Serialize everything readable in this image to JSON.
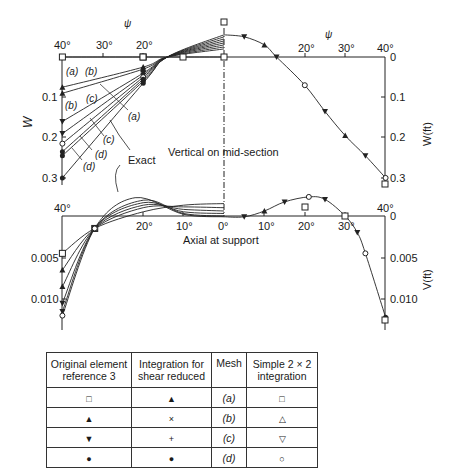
{
  "chart_data": [
    {
      "type": "line",
      "title": "Vertical on mid-section",
      "xlabel": "ψ",
      "ylabel_left": "W",
      "ylabel_right": "W(ft)",
      "x_ticks_left": [
        "40°",
        "30°",
        "20°"
      ],
      "x_ticks_right": [
        "20°",
        "30°",
        "40°"
      ],
      "y_ticks": [
        "0",
        "0.1",
        "0.2",
        "0.3"
      ],
      "ylim": [
        -0.06,
        0.32
      ],
      "y_inverted": true,
      "grid": false,
      "left_half_curves": [
        {
          "name": "(a) original/simple",
          "points": [
            [
              40,
              0.0
            ],
            [
              20,
              0.0
            ],
            [
              0,
              0.0
            ]
          ]
        },
        {
          "name": "(b)",
          "points": [
            [
              40,
              0.075
            ],
            [
              20,
              0.025
            ],
            [
              14,
              0.0
            ],
            [
              0,
              -0.02
            ]
          ]
        },
        {
          "name": "(b')",
          "points": [
            [
              40,
              0.09
            ],
            [
              20,
              0.03
            ],
            [
              14,
              0.0
            ],
            [
              0,
              -0.025
            ]
          ]
        },
        {
          "name": "(c)",
          "points": [
            [
              40,
              0.16
            ],
            [
              20,
              0.04
            ],
            [
              14,
              0.0
            ],
            [
              0,
              -0.03
            ]
          ]
        },
        {
          "name": "(c')",
          "points": [
            [
              40,
              0.19
            ],
            [
              20,
              0.045
            ],
            [
              14,
              0.0
            ],
            [
              0,
              -0.035
            ]
          ]
        },
        {
          "name": "(a) reduced",
          "points": [
            [
              40,
              0.215
            ],
            [
              20,
              0.05
            ],
            [
              14,
              0.0
            ],
            [
              0,
              -0.04
            ]
          ]
        },
        {
          "name": "(d)",
          "points": [
            [
              40,
              0.235
            ],
            [
              20,
              0.055
            ],
            [
              14,
              0.0
            ],
            [
              0,
              -0.045
            ]
          ]
        },
        {
          "name": "(d')",
          "points": [
            [
              40,
              0.245
            ],
            [
              20,
              0.06
            ],
            [
              14,
              0.0
            ],
            [
              0,
              -0.05
            ]
          ]
        },
        {
          "name": "Exact",
          "points": [
            [
              40,
              0.3
            ],
            [
              20,
              0.065
            ],
            [
              14,
              0.0
            ],
            [
              0,
              -0.055
            ]
          ]
        }
      ],
      "right_half_curve": {
        "name": "Exact / converged",
        "points": [
          [
            0,
            -0.055
          ],
          [
            5,
            -0.05
          ],
          [
            10,
            -0.03
          ],
          [
            13,
            0.0
          ],
          [
            20,
            0.07
          ],
          [
            25,
            0.135
          ],
          [
            30,
            0.195
          ],
          [
            35,
            0.245
          ],
          [
            40,
            0.3
          ]
        ]
      },
      "curve_labels": [
        "(a)",
        "(b)",
        "(b)",
        "(c)",
        "(a)",
        "(c)",
        "(d)",
        "(d)",
        "Exact"
      ]
    },
    {
      "type": "line",
      "title": "Axial at support",
      "xlabel": "",
      "ylabel_right": "V(ft)",
      "x_ticks_left": [
        "40°",
        "20°",
        "10°",
        "0°"
      ],
      "x_ticks_right": [
        "10°",
        "20°",
        "30°",
        "40°"
      ],
      "y_ticks": [
        "0",
        "0.005",
        "0.010"
      ],
      "ylim": [
        -0.0025,
        0.0135
      ],
      "y_inverted": true,
      "grid": false,
      "left_half_curves": [
        {
          "name": "c1",
          "points": [
            [
              40,
              0.0045
            ],
            [
              32,
              0.0015
            ],
            [
              20,
              -0.0005
            ],
            [
              10,
              -0.0013
            ],
            [
              0,
              -0.0015
            ]
          ]
        },
        {
          "name": "c2",
          "points": [
            [
              40,
              0.0065
            ],
            [
              32,
              0.0015
            ],
            [
              20,
              -0.001
            ],
            [
              10,
              -0.0011
            ],
            [
              0,
              -0.001
            ]
          ]
        },
        {
          "name": "c3",
          "points": [
            [
              40,
              0.0085
            ],
            [
              32,
              0.0015
            ],
            [
              20,
              -0.0013
            ],
            [
              10,
              -0.0008
            ],
            [
              0,
              -0.0006
            ]
          ]
        },
        {
          "name": "c4",
          "points": [
            [
              40,
              0.0105
            ],
            [
              32,
              0.0015
            ],
            [
              20,
              -0.0016
            ],
            [
              10,
              -0.0005
            ],
            [
              0,
              -0.0003
            ]
          ]
        },
        {
          "name": "c5",
          "points": [
            [
              40,
              0.0115
            ],
            [
              32,
              0.0015
            ],
            [
              20,
              -0.0019
            ],
            [
              10,
              -0.0003
            ],
            [
              0,
              0.0
            ]
          ]
        },
        {
          "name": "Exact",
          "points": [
            [
              40,
              0.012
            ],
            [
              32,
              0.0015
            ],
            [
              22,
              -0.0022
            ],
            [
              10,
              -0.0002
            ],
            [
              0,
              0.0001
            ]
          ]
        }
      ],
      "right_half_curve": {
        "name": "Exact / converged",
        "points": [
          [
            0,
            0.0001
          ],
          [
            5,
            0.0001
          ],
          [
            10,
            -0.0006
          ],
          [
            15,
            -0.0017
          ],
          [
            21,
            -0.0023
          ],
          [
            25,
            -0.002
          ],
          [
            30,
            0.0
          ],
          [
            33,
            0.002
          ],
          [
            35,
            0.0045
          ],
          [
            40,
            0.0122
          ]
        ]
      }
    }
  ],
  "legend_table": {
    "headers": [
      "Original element\nreference 3",
      "Integration for\nshear reduced",
      "Mesh",
      "Simple 2 × 2\nintegration"
    ],
    "header_lines": [
      [
        "Original element",
        "reference 3"
      ],
      [
        "Integration for",
        "shear reduced"
      ],
      [
        "Mesh"
      ],
      [
        "Simple 2 × 2",
        "integration"
      ]
    ],
    "rows": [
      {
        "original": "□",
        "reduced": "▲",
        "mesh": "(a)",
        "simple": "□"
      },
      {
        "original": "▲",
        "reduced": "×",
        "mesh": "(b)",
        "simple": "△"
      },
      {
        "original": "▼",
        "reduced": "+",
        "mesh": "(c)",
        "simple": "▽"
      },
      {
        "original": "●",
        "reduced": "●",
        "mesh": "(d)",
        "simple": "○"
      }
    ]
  },
  "labels": {
    "psi_left": "ψ",
    "psi_right": "ψ",
    "W": "W",
    "W_ft": "W(ft)",
    "V_ft": "V(ft)",
    "vertical": "Vertical on mid-section",
    "axial": "Axial at support",
    "exact": "Exact",
    "ticks_top_left": [
      "40°",
      "30°",
      "20°"
    ],
    "ticks_top_right": [
      "20°",
      "30°",
      "40°"
    ],
    "ticks_W": [
      "0",
      "0.1",
      "0.2",
      "0.3"
    ],
    "ticks_W_left": [
      "0.1",
      "0.2",
      "0.3"
    ],
    "ticks_bot_left": [
      "40°",
      "20°",
      "10°",
      "0°"
    ],
    "ticks_bot_right": [
      "10°",
      "20°",
      "30°",
      "40°"
    ],
    "ticks_V": [
      "0",
      "0.005",
      "0.010"
    ],
    "ticks_V_left": [
      "0.005",
      "0.010"
    ],
    "curve_tags": [
      "(a)",
      "(b)",
      "(b)",
      "(c)",
      "(a)",
      "(c)",
      "(d)",
      "(d)"
    ]
  }
}
